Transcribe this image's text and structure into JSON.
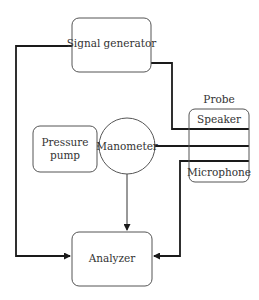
{
  "diagram": {
    "type": "block-diagram",
    "nodes": {
      "signal_generator": {
        "label": "Signal generator"
      },
      "pressure_pump": {
        "label_line1": "Pressure",
        "label_line2": "pump"
      },
      "manometer": {
        "label": "Manometer"
      },
      "probe": {
        "title": "Probe",
        "speaker": "Speaker",
        "microphone": "Microphone"
      },
      "analyzer": {
        "label": "Analyzer"
      }
    },
    "edges": [
      {
        "from": "signal_generator",
        "to": "analyzer",
        "arrow": true
      },
      {
        "from": "signal_generator",
        "to": "probe.speaker",
        "arrow": false
      },
      {
        "from": "pressure_pump",
        "to": "manometer",
        "arrow": false
      },
      {
        "from": "manometer",
        "to": "probe",
        "arrow": false
      },
      {
        "from": "manometer",
        "to": "analyzer",
        "arrow": true
      },
      {
        "from": "probe.microphone",
        "to": "analyzer",
        "arrow": true
      }
    ],
    "colors": {
      "line": "#1a1a1a",
      "box_stroke": "#555555",
      "text": "#333333"
    }
  }
}
